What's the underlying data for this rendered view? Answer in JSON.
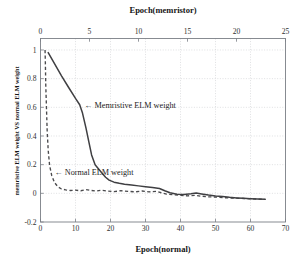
{
  "chart_data": {
    "type": "line",
    "title": "",
    "top_axis": {
      "label": "Epoch(memristor)",
      "ticks": [
        0,
        5,
        10,
        15,
        20,
        25
      ],
      "range": [
        0,
        25
      ]
    },
    "bottom_axis": {
      "label": "Epoch(normal)",
      "ticks": [
        0,
        10,
        20,
        30,
        40,
        50,
        60,
        70
      ],
      "range": [
        0,
        70
      ]
    },
    "ylabel": "memristive ELM weight VS normal ELM weight",
    "yticks": [
      "1",
      "0.8",
      "0.6",
      "0.4",
      "0.2",
      "0",
      "-0.2"
    ],
    "ylim": [
      -0.2,
      1.08
    ],
    "grid": true,
    "legend_position": "inline-annotations",
    "annotations": [
      {
        "name": "memristive-annotation",
        "text": "← Memristive ELM weight",
        "x_normal": 12.5,
        "y": 0.615
      },
      {
        "name": "normal-annotation",
        "text": "← Normal ELM weight",
        "x_normal": 4.0,
        "y": 0.145
      }
    ],
    "series": [
      {
        "name": "Memristive ELM weight",
        "style": "solid",
        "color": "#3f3f42",
        "x_axis": "bottom",
        "x": [
          2.2,
          4.0,
          6.0,
          8.0,
          10.0,
          11.2,
          12.0,
          13.0,
          13.8,
          14.6,
          15.6,
          16.6,
          17.6,
          18.6,
          19.6,
          21.0,
          22.5,
          24.0,
          26.0,
          28.0,
          30.0,
          32.0,
          34.0,
          35.5,
          37.0,
          39.0,
          41.0,
          43.0,
          44.5,
          46.0,
          48.0,
          50.0,
          52.0,
          54.0,
          56.0,
          58.0,
          60.0,
          62.0,
          64.2
        ],
        "y": [
          0.982,
          0.905,
          0.82,
          0.74,
          0.662,
          0.618,
          0.56,
          0.455,
          0.36,
          0.268,
          0.2,
          0.17,
          0.14,
          0.112,
          0.092,
          0.078,
          0.07,
          0.063,
          0.058,
          0.052,
          0.046,
          0.04,
          0.034,
          0.018,
          0.004,
          -0.006,
          -0.008,
          -0.003,
          0.002,
          -0.004,
          -0.012,
          -0.018,
          -0.022,
          -0.028,
          -0.032,
          -0.035,
          -0.038,
          -0.04,
          -0.042
        ]
      },
      {
        "name": "Normal ELM weight",
        "style": "dashed",
        "color": "#4a4a4d",
        "x_axis": "bottom",
        "x": [
          1.3,
          1.4,
          1.5,
          1.7,
          1.9,
          2.2,
          2.6,
          3.2,
          4.0,
          5.0,
          6.0,
          7.2,
          8.5,
          10.0,
          11.5,
          13.0,
          14.5,
          16.0,
          17.5,
          19.0,
          21.0,
          23.0,
          25.0,
          27.0,
          29.0,
          31.0,
          33.0,
          34.5,
          36.0,
          38.0,
          40.0,
          42.0,
          44.0,
          46.0,
          48.0,
          50.0,
          52.0,
          54.0,
          56.0,
          58.0,
          60.0,
          62.0,
          64.0
        ],
        "y": [
          1.0,
          0.9,
          0.76,
          0.6,
          0.44,
          0.3,
          0.195,
          0.125,
          0.075,
          0.045,
          0.03,
          0.024,
          0.02,
          0.022,
          0.018,
          0.026,
          0.02,
          0.016,
          0.022,
          0.016,
          0.012,
          0.018,
          0.014,
          0.01,
          0.016,
          0.01,
          0.014,
          0.004,
          -0.006,
          -0.01,
          -0.014,
          -0.018,
          -0.014,
          -0.02,
          -0.024,
          -0.026,
          -0.03,
          -0.032,
          -0.034,
          -0.036,
          -0.038,
          -0.04,
          -0.042
        ]
      }
    ]
  },
  "colors": {
    "frame": "#7b7f86",
    "grid": "#c9cbcf",
    "solid_curve": "#3f3f42",
    "dashed_curve": "#4a4a4d",
    "text": "#1b1b1b",
    "background": "#ffffff"
  }
}
